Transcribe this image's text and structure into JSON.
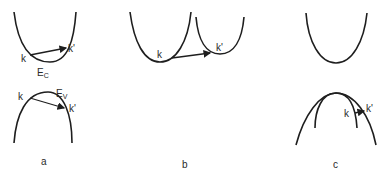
{
  "figure": {
    "panels": [
      {
        "id": "a",
        "caption": "a",
        "labels": {
          "k_top": "k",
          "kprime_top": "k'",
          "ec": "E",
          "ec_sub": "C",
          "k_bottom": "k",
          "kprime_bottom": "k'",
          "ev": "E",
          "ev_sub": "V"
        }
      },
      {
        "id": "b",
        "caption": "b",
        "labels": {
          "k": "k",
          "kprime": "k'"
        }
      },
      {
        "id": "c",
        "caption": "c",
        "labels": {
          "k": "k",
          "kprime": "k'"
        }
      }
    ],
    "colors": {
      "stroke": "#1e1e1e",
      "background": "#ffffff"
    }
  }
}
